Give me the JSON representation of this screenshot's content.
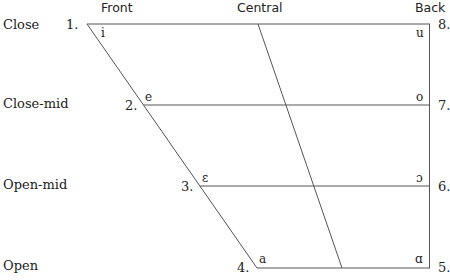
{
  "columns": {
    "front": "Front",
    "central": "Central",
    "back": "Back"
  },
  "rows": {
    "close": "Close",
    "close_mid": "Close-mid",
    "open_mid": "Open-mid",
    "open": "Open"
  },
  "vowels": [
    {
      "num": "1.",
      "symbol": "i"
    },
    {
      "num": "2.",
      "symbol": "e"
    },
    {
      "num": "3.",
      "symbol": "ɛ"
    },
    {
      "num": "4.",
      "symbol": "a"
    },
    {
      "num": "5.",
      "symbol": "ɑ"
    },
    {
      "num": "6.",
      "symbol": "ɔ"
    },
    {
      "num": "7.",
      "symbol": "o"
    },
    {
      "num": "8.",
      "symbol": "u"
    }
  ],
  "style": {
    "line_color": "#555555"
  }
}
